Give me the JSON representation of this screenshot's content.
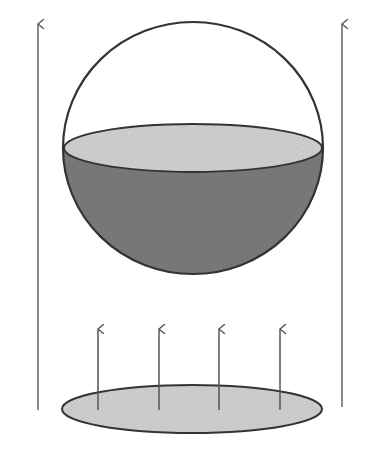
{
  "diagram": {
    "colors": {
      "background": "#ffffff",
      "outline": "#333333",
      "liquid": "#777777",
      "speckle_base": "#cfcfcf",
      "arrow": "#555555"
    },
    "sphere": {
      "cx": 193,
      "cy": 148,
      "rx": 130,
      "ry": 126
    },
    "liquid_surface": {
      "cx": 193,
      "cy": 148,
      "rx": 129,
      "ry": 24
    },
    "disk": {
      "cx": 192,
      "cy": 409,
      "rx": 130,
      "ry": 24
    },
    "side_arrows": [
      {
        "x": 38,
        "y_top": 23,
        "y_bottom": 410
      },
      {
        "x": 342,
        "y_top": 23,
        "y_bottom": 407
      }
    ],
    "disk_arrows": [
      {
        "x": 98,
        "y_top": 328,
        "y_bottom": 410
      },
      {
        "x": 159,
        "y_top": 328,
        "y_bottom": 410
      },
      {
        "x": 219,
        "y_top": 328,
        "y_bottom": 410
      },
      {
        "x": 280,
        "y_top": 328,
        "y_bottom": 410
      }
    ]
  }
}
